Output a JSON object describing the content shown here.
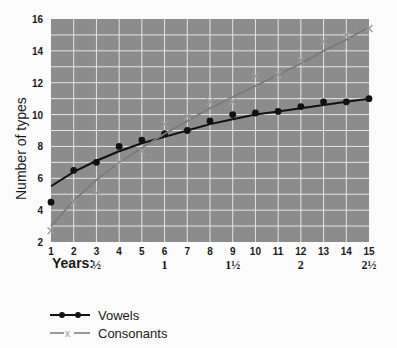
{
  "chart_data": {
    "type": "line",
    "title": "",
    "xlabel": "Years:",
    "ylabel": "Number of types",
    "x": [
      1,
      2,
      3,
      4,
      5,
      6,
      7,
      8,
      9,
      10,
      11,
      12,
      13,
      14,
      15
    ],
    "xlim": [
      1,
      15
    ],
    "ylim": [
      2,
      16
    ],
    "yticks": [
      2,
      4,
      6,
      8,
      10,
      12,
      14,
      16
    ],
    "age_labels": [
      {
        "at": 3,
        "label": "½"
      },
      {
        "at": 6,
        "label": "1"
      },
      {
        "at": 9,
        "label": "1½"
      },
      {
        "at": 12,
        "label": "2"
      },
      {
        "at": 15,
        "label": "2½"
      }
    ],
    "grid": true,
    "legend_position": "bottom-left",
    "series": [
      {
        "name": "Vowels",
        "marker": "dot",
        "color": "#111111",
        "values": [
          4.5,
          6.5,
          7.0,
          8.0,
          8.4,
          8.8,
          9.0,
          9.6,
          10.0,
          10.1,
          10.2,
          10.5,
          10.8,
          10.8,
          11.0
        ],
        "fit": [
          5.5,
          6.4,
          7.1,
          7.7,
          8.2,
          8.6,
          9.0,
          9.4,
          9.7,
          10.0,
          10.2,
          10.4,
          10.6,
          10.8,
          11.0
        ]
      },
      {
        "name": "Consonants",
        "marker": "x",
        "color": "#8a8a8a",
        "values": [
          2.7,
          4.5,
          5.1,
          7.0,
          7.7,
          9.4,
          9.9,
          10.8,
          10.8,
          12.4,
          12.5,
          13.4,
          14.6,
          15.0,
          15.4
        ],
        "fit": [
          3.0,
          4.6,
          5.9,
          7.0,
          7.9,
          8.8,
          9.6,
          10.4,
          11.1,
          11.8,
          12.5,
          13.2,
          14.0,
          14.7,
          15.5
        ]
      }
    ]
  },
  "legend": {
    "vowels_label": "Vowels",
    "consonants_label": "Consonants"
  },
  "style": {
    "plot_bg": "#8c8c8c",
    "grid_color": "#e6e6e6"
  }
}
